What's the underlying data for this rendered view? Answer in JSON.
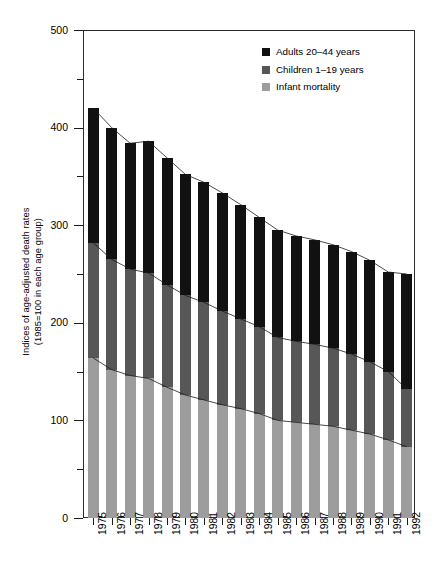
{
  "chart_data": {
    "type": "bar",
    "subtype": "stacked-bar",
    "title": "",
    "xlabel": "",
    "ylabel": "Indices of age-adjusted death rates\n(1985=100 in each age group)",
    "ylim": [
      0,
      500
    ],
    "y_ticks_major": [
      0,
      100,
      200,
      300,
      400,
      500
    ],
    "y_ticks_minor": [
      50,
      150,
      250,
      350,
      450
    ],
    "grid": false,
    "legend_position": "top-right",
    "categories": [
      "1975",
      "1976",
      "1977",
      "1978",
      "1979",
      "1980",
      "1981",
      "1982",
      "1983",
      "1984",
      "1985",
      "1986",
      "1987",
      "1988",
      "1989",
      "1990",
      "1991",
      "1992"
    ],
    "series": [
      {
        "name": "Infant mortality",
        "color": "#9d9d9d",
        "values": [
          164,
          152,
          146,
          143,
          134,
          126,
          121,
          116,
          112,
          107,
          100,
          98,
          96,
          94,
          90,
          86,
          80,
          73
        ]
      },
      {
        "name": "Children 1–19 years",
        "color": "#575757",
        "values": [
          118,
          113,
          109,
          108,
          105,
          102,
          100,
          96,
          92,
          89,
          85,
          83,
          82,
          80,
          78,
          74,
          70,
          59
        ]
      },
      {
        "name": "Adults 20–44 years",
        "color": "#111111",
        "values": [
          138,
          135,
          129,
          135,
          130,
          124,
          123,
          121,
          117,
          112,
          110,
          108,
          107,
          106,
          105,
          104,
          102,
          118
        ]
      }
    ],
    "totals": [
      420,
      400,
      384,
      386,
      369,
      352,
      344,
      333,
      321,
      308,
      295,
      289,
      285,
      280,
      273,
      264,
      252,
      250
    ]
  },
  "legend": {
    "items": [
      {
        "label": "Adults 20–44 years",
        "color": "#111111"
      },
      {
        "label": "Children 1–19 years",
        "color": "#575757"
      },
      {
        "label": "Infant mortality",
        "color": "#9d9d9d"
      }
    ]
  },
  "axes": {
    "y_title": "Indices of age-adjusted death rates\n(1985=100 in each age group)",
    "y_tick_labels": [
      "500",
      "400",
      "300",
      "200",
      "100",
      "0"
    ]
  }
}
